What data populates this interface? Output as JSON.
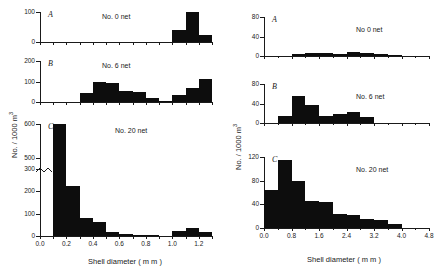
{
  "figure": {
    "axis_label_y": "No. / 1000 m",
    "axis_label_y_sup": "3",
    "axis_label_x": "Shell  diameter  ( m m )",
    "ink_color": "#0d0d0d"
  },
  "chart_data": [
    {
      "id": "left-A",
      "type": "bar",
      "panel_letter": "A",
      "annotation": "No. 0 net",
      "title": "",
      "xlabel": "Shell diameter (mm)",
      "ylabel": "No. / 1000 m3",
      "xlim": [
        0.0,
        1.3
      ],
      "ylim": [
        0,
        100
      ],
      "yticks": [
        0,
        100
      ],
      "ytick_labels": [
        "0",
        "100"
      ],
      "xticks": [
        0.0,
        0.1,
        0.2,
        0.3,
        0.4,
        0.5,
        0.6,
        0.7,
        0.8,
        0.9,
        1.0,
        1.1,
        1.2,
        1.3
      ],
      "bin_width": 0.1,
      "bin_starts": [
        0.0,
        0.1,
        0.2,
        0.3,
        0.4,
        0.5,
        0.6,
        0.7,
        0.8,
        0.9,
        1.0,
        1.1,
        1.2
      ],
      "values": [
        0,
        0,
        0,
        0,
        0,
        0,
        0,
        0,
        0,
        0,
        40,
        100,
        22
      ]
    },
    {
      "id": "left-B",
      "type": "bar",
      "panel_letter": "B",
      "annotation": "No.  6 net",
      "xlabel": "Shell diameter (mm)",
      "ylabel": "No. / 1000 m3",
      "xlim": [
        0.0,
        1.3
      ],
      "ylim": [
        0,
        200
      ],
      "yticks": [
        0,
        100,
        200
      ],
      "ytick_labels": [
        "0",
        "100",
        "200"
      ],
      "xticks": [
        0.0,
        0.1,
        0.2,
        0.3,
        0.4,
        0.5,
        0.6,
        0.7,
        0.8,
        0.9,
        1.0,
        1.1,
        1.2,
        1.3
      ],
      "bin_width": 0.1,
      "bin_starts": [
        0.0,
        0.1,
        0.2,
        0.3,
        0.4,
        0.5,
        0.6,
        0.7,
        0.8,
        0.9,
        1.0,
        1.1,
        1.2
      ],
      "values": [
        0,
        0,
        0,
        45,
        100,
        92,
        55,
        50,
        22,
        5,
        35,
        68,
        110,
        40
      ]
    },
    {
      "id": "left-C",
      "type": "bar",
      "panel_letter": "C",
      "annotation": "No. 20 net",
      "xlabel": "Shell diameter (mm)",
      "ylabel": "No. / 1000 m3",
      "xlim": [
        0.0,
        1.3
      ],
      "ylim": [
        0,
        600
      ],
      "yticks": [
        0,
        100,
        200,
        300,
        500,
        600
      ],
      "ytick_labels": [
        "0",
        "100",
        "200",
        "300",
        "500",
        "600"
      ],
      "axis_break": true,
      "axis_break_between": [
        300,
        500
      ],
      "xticks": [
        0.0,
        0.1,
        0.2,
        0.3,
        0.4,
        0.5,
        0.6,
        0.7,
        0.8,
        0.9,
        1.0,
        1.1,
        1.2,
        1.3
      ],
      "bin_width": 0.1,
      "bin_starts": [
        0.0,
        0.1,
        0.2,
        0.3,
        0.4,
        0.5,
        0.6,
        0.7,
        0.8,
        0.9,
        1.0,
        1.1,
        1.2
      ],
      "values": [
        0,
        600,
        225,
        80,
        62,
        18,
        10,
        4,
        6,
        0,
        22,
        38,
        18
      ]
    },
    {
      "id": "right-A",
      "type": "bar",
      "panel_letter": "A",
      "annotation": "No  0  net",
      "xlabel": "Shell diameter (mm)",
      "ylabel": "No. / 1000 m3",
      "xlim": [
        0.0,
        4.8
      ],
      "ylim": [
        0,
        80
      ],
      "yticks": [
        0,
        40,
        80
      ],
      "ytick_labels": [
        "0",
        "40",
        "80"
      ],
      "xticks": [
        0.0,
        0.8,
        1.6,
        2.4,
        3.2,
        4.0,
        4.8
      ],
      "xtick_labels": [
        "0.0",
        "0.8",
        "1.6",
        "2.4",
        "3.2",
        "4.0",
        "4.8"
      ],
      "bin_width": 0.4,
      "bin_starts": [
        0.0,
        0.4,
        0.8,
        1.2,
        1.6,
        2.0,
        2.4,
        2.8,
        3.2,
        3.6,
        4.0,
        4.4
      ],
      "values": [
        0,
        0,
        4,
        7,
        6,
        5,
        9,
        6,
        4,
        2,
        0,
        0
      ]
    },
    {
      "id": "right-B",
      "type": "bar",
      "panel_letter": "B",
      "annotation": "No.  6  net",
      "xlabel": "Shell diameter (mm)",
      "ylabel": "No. / 1000 m3",
      "xlim": [
        0.0,
        4.8
      ],
      "ylim": [
        0,
        80
      ],
      "yticks": [
        0,
        40,
        80
      ],
      "ytick_labels": [
        "0",
        "40",
        "80"
      ],
      "xticks": [
        0.0,
        0.8,
        1.6,
        2.4,
        3.2,
        4.0,
        4.8
      ],
      "xtick_labels": [
        "0.0",
        "0.8",
        "1.6",
        "2.4",
        "3.2",
        "4.0",
        "4.8"
      ],
      "bin_width": 0.4,
      "bin_starts": [
        0.0,
        0.4,
        0.8,
        1.2,
        1.6,
        2.0,
        2.4,
        2.8,
        3.2,
        3.6,
        4.0,
        4.4
      ],
      "values": [
        0,
        14,
        55,
        36,
        14,
        18,
        23,
        13,
        0,
        0,
        0,
        0
      ]
    },
    {
      "id": "right-C",
      "type": "bar",
      "panel_letter": "C",
      "annotation": "No.  20  net",
      "xlabel": "Shell diameter (mm)",
      "ylabel": "No. / 1000 m3",
      "xlim": [
        0.0,
        4.8
      ],
      "ylim": [
        0,
        120
      ],
      "yticks": [
        0,
        40,
        80,
        120
      ],
      "ytick_labels": [
        "0",
        "40",
        "80",
        "120"
      ],
      "xticks": [
        0.0,
        0.8,
        1.6,
        2.4,
        3.2,
        4.0,
        4.8
      ],
      "xtick_labels": [
        "0.0",
        "0.8",
        "1.6",
        "2.4",
        "3.2",
        "4.0",
        "4.8"
      ],
      "bin_width": 0.4,
      "bin_starts": [
        0.0,
        0.4,
        0.8,
        1.2,
        1.6,
        2.0,
        2.4,
        2.8,
        3.2,
        3.6,
        4.0,
        4.4
      ],
      "values": [
        65,
        115,
        79,
        45,
        44,
        24,
        22,
        16,
        13,
        6,
        0,
        0
      ]
    }
  ]
}
